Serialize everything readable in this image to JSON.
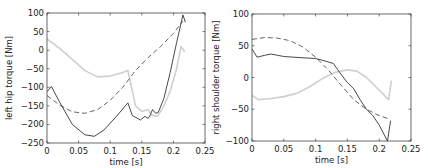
{
  "chart_data": [
    {
      "type": "line",
      "title": "",
      "xlabel": "time [s]",
      "ylabel": "left hip torque [Nm]",
      "xlim": [
        0,
        0.25
      ],
      "ylim": [
        -250,
        100
      ],
      "xticks": [
        0,
        0.05,
        0.1,
        0.15,
        0.2,
        0.25
      ],
      "xtick_labels": [
        "0",
        "0.05",
        "0.1",
        "0.15",
        "0.2",
        "0.25"
      ],
      "yticks": [
        100,
        50,
        0,
        -50,
        -100,
        -150,
        -200,
        -250
      ],
      "ytick_labels": [
        "100",
        "50",
        "0",
        "−50",
        "−100",
        "−150",
        "−200",
        "−250"
      ],
      "grid": false,
      "legend": null,
      "series": [
        {
          "name": "solid-dark",
          "color": "#333333",
          "style": "solid",
          "x": [
            0,
            0.007,
            0.02,
            0.04,
            0.06,
            0.075,
            0.09,
            0.11,
            0.128,
            0.135,
            0.148,
            0.155,
            0.16,
            0.163,
            0.167,
            0.172,
            0.176,
            0.185,
            0.195,
            0.205,
            0.215,
            0.219
          ],
          "y": [
            -112,
            -98,
            -140,
            -200,
            -228,
            -232,
            -215,
            -178,
            -142,
            -176,
            -188,
            -178,
            -184,
            -176,
            -160,
            -170,
            -168,
            -130,
            -60,
            20,
            95,
            75
          ]
        },
        {
          "name": "dashed",
          "color": "#555555",
          "style": "dashed",
          "x": [
            0,
            0.02,
            0.04,
            0.06,
            0.08,
            0.1,
            0.12,
            0.14,
            0.16,
            0.18,
            0.2,
            0.215
          ],
          "y": [
            -122,
            -148,
            -166,
            -170,
            -160,
            -135,
            -100,
            -55,
            -20,
            10,
            45,
            78
          ]
        },
        {
          "name": "solid-light",
          "color": "#cfcfcf",
          "style": "solid",
          "x": [
            0,
            0.02,
            0.04,
            0.06,
            0.08,
            0.1,
            0.12,
            0.128,
            0.14,
            0.15,
            0.16,
            0.165,
            0.175,
            0.185,
            0.195,
            0.205,
            0.212,
            0.218
          ],
          "y": [
            30,
            5,
            -25,
            -55,
            -72,
            -70,
            -60,
            -55,
            -150,
            -165,
            -160,
            -175,
            -178,
            -150,
            -110,
            -50,
            10,
            -5
          ]
        }
      ]
    },
    {
      "type": "line",
      "title": "",
      "xlabel": "time [s]",
      "ylabel": "right shoulder torque [Nm]",
      "xlim": [
        0,
        0.25
      ],
      "ylim": [
        -100,
        100
      ],
      "xticks": [
        0,
        0.05,
        0.1,
        0.15,
        0.2,
        0.25
      ],
      "xtick_labels": [
        "0",
        "0.05",
        "0.1",
        "0.15",
        "0.2",
        "0.25"
      ],
      "yticks": [
        100,
        50,
        0,
        -50,
        -100
      ],
      "ytick_labels": [
        "100",
        "50",
        "0",
        "−50",
        "−100"
      ],
      "grid": false,
      "legend": null,
      "series": [
        {
          "name": "solid-dark",
          "color": "#333333",
          "style": "solid",
          "x": [
            0,
            0.008,
            0.02,
            0.03,
            0.05,
            0.08,
            0.1,
            0.115,
            0.128,
            0.14,
            0.15,
            0.16,
            0.17,
            0.18,
            0.19,
            0.2,
            0.213,
            0.218
          ],
          "y": [
            45,
            32,
            35,
            37,
            33,
            31,
            30,
            26,
            22,
            5,
            -8,
            -18,
            -35,
            -50,
            -60,
            -75,
            -100,
            -68
          ]
        },
        {
          "name": "dashed",
          "color": "#555555",
          "style": "dashed",
          "x": [
            0,
            0.02,
            0.04,
            0.06,
            0.08,
            0.1,
            0.12,
            0.14,
            0.16,
            0.18,
            0.2,
            0.215
          ],
          "y": [
            60,
            63,
            62,
            58,
            48,
            32,
            12,
            -12,
            -35,
            -50,
            -60,
            -65
          ]
        },
        {
          "name": "solid-light",
          "color": "#cfcfcf",
          "style": "solid",
          "x": [
            0,
            0.01,
            0.03,
            0.05,
            0.07,
            0.09,
            0.11,
            0.13,
            0.15,
            0.165,
            0.18,
            0.195,
            0.21,
            0.215,
            0.219
          ],
          "y": [
            -28,
            -35,
            -33,
            -30,
            -25,
            -15,
            -2,
            8,
            12,
            10,
            0,
            -15,
            -30,
            -35,
            -5
          ]
        }
      ]
    }
  ]
}
